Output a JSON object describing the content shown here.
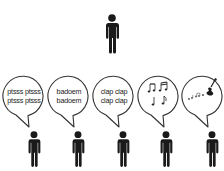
{
  "title_fragment": "",
  "top_person": {
    "icon": "person-icon",
    "color": "#1a1a1a"
  },
  "bubbles": [
    {
      "kind": "text",
      "line1": "ptsss ptsss",
      "line2": "ptsss ptsss"
    },
    {
      "kind": "text",
      "line1": "badoem",
      "line2": "badoem"
    },
    {
      "kind": "text",
      "line1": "clap clap",
      "line2": "clap clap"
    },
    {
      "kind": "icon",
      "icon": "music-notes-icon"
    },
    {
      "kind": "icon",
      "icon": "violin-with-notes-icon"
    }
  ],
  "people": [
    {
      "icon": "person-icon"
    },
    {
      "icon": "person-icon"
    },
    {
      "icon": "person-icon"
    },
    {
      "icon": "person-icon"
    },
    {
      "icon": "person-icon"
    }
  ],
  "colors": {
    "figure": "#1a1a1a",
    "bubble_stroke": "#333333",
    "text": "#222222"
  }
}
